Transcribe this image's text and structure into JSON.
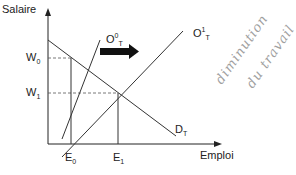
{
  "diagram": {
    "type": "supply-demand labor market shift",
    "axes": {
      "y_label": "Salaire",
      "x_label": "Emploi"
    },
    "curves": {
      "supply_initial": {
        "base": "O",
        "sup": "0",
        "sub": "T"
      },
      "supply_shifted": {
        "base": "O",
        "sup": "1",
        "sub": "T"
      },
      "demand": {
        "base": "D",
        "sub": "T"
      }
    },
    "levels": {
      "w0": {
        "base": "W",
        "sub": "0"
      },
      "w1": {
        "base": "W",
        "sub": "1"
      },
      "e0": {
        "base": "E",
        "sub": "0"
      },
      "e1": {
        "base": "E",
        "sub": "1"
      }
    },
    "shift_arrow": "right-arrow",
    "handwritten_note": {
      "line1": "diminution",
      "line2": "du travail"
    },
    "colors": {
      "line": "#333333",
      "dashed": "#555555",
      "handwriting": "#a0a0a0"
    }
  }
}
